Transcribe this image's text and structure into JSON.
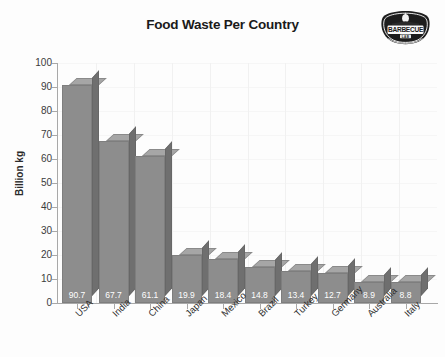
{
  "chart_data": {
    "type": "bar",
    "title": "Food Waste Per Country",
    "xlabel": "",
    "ylabel": "Billion kg",
    "ylim": [
      0,
      100
    ],
    "y_ticks": [
      0,
      10,
      20,
      30,
      40,
      50,
      60,
      70,
      80,
      90,
      100
    ],
    "grid": true,
    "legend": "none",
    "style": "3d-bar",
    "bar_color": "#8d8d8d",
    "bar_top_color": "#a6a6a6",
    "bar_side_color": "#6f6f6f",
    "data_label_color": "#ffffff",
    "categories": [
      "USA",
      "India",
      "China",
      "Japan",
      "Mexico",
      "Brazil",
      "Turkey",
      "Germany",
      "Australia",
      "Italy"
    ],
    "values": [
      90.7,
      67.7,
      61.1,
      19.9,
      18.4,
      14.8,
      13.4,
      12.7,
      8.9,
      8.8
    ],
    "value_labels": [
      "90.7",
      "67.7",
      "61.1",
      "19.9",
      "18.4",
      "14.8",
      "13.4",
      "12.7",
      "8.9",
      "8.8"
    ]
  },
  "logo": {
    "name": "barbecue-lab-logo",
    "primary_text": "BARBECUE",
    "secondary_text": "LAB",
    "color": "#1d1d1d"
  }
}
